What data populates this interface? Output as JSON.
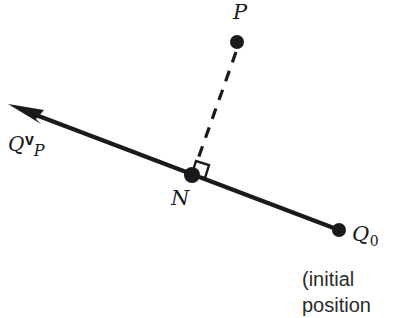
{
  "figure": {
    "background_color": "#ffffff",
    "ink_color": "#1a1a1a",
    "width": 393,
    "height": 318
  },
  "points": {
    "p": {
      "label": "P",
      "x": 237,
      "y": 42,
      "label_x": 233,
      "label_y": 2
    },
    "n": {
      "label": "N",
      "x": 192,
      "y": 175,
      "label_x": 171,
      "label_y": 188
    },
    "q0": {
      "label": "Q",
      "subscript": "0",
      "x": 339,
      "y": 230,
      "label_x": 352,
      "label_y": 224
    }
  },
  "vector_label": {
    "base": "Q",
    "superscript": "v",
    "subscript": "P",
    "x": 8,
    "y": 132
  },
  "caption": {
    "line1": "(initial",
    "line2": "position"
  },
  "geometry": {
    "line_type": "solid",
    "arrow_tip_x": 8,
    "arrow_tip_y": 104,
    "dashed_segment": "P to N",
    "right_angle_marker": true
  }
}
